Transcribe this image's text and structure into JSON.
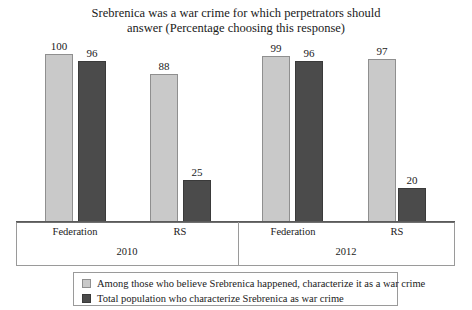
{
  "chart_data": {
    "type": "bar",
    "title": "Srebrenica was a war crime for which perpetrators should answer (Percentage choosing this response)",
    "title_line1": "Srebrenica was a war crime for which perpetrators should",
    "title_line2": "answer (Percentage choosing this response)",
    "xlabel": "",
    "ylabel": "",
    "ylim": [
      0,
      100
    ],
    "grid": false,
    "legend_position": "bottom",
    "categories": [
      "Federation",
      "RS",
      "Federation",
      "RS"
    ],
    "groups": [
      {
        "label": "2010",
        "categories": [
          "Federation",
          "RS"
        ]
      },
      {
        "label": "2012",
        "categories": [
          "Federation",
          "RS"
        ]
      }
    ],
    "series": [
      {
        "name": "Among those who believe Srebrenica happened, characterize it as a war crime",
        "color": "#c9c9c9",
        "values": [
          100,
          88,
          99,
          97
        ]
      },
      {
        "name": "Total population who characterize Srebrenica as war crime",
        "color": "#4b4b4b",
        "values": [
          96,
          25,
          96,
          20
        ]
      }
    ],
    "bars": [
      {
        "group": "2010",
        "category": "Federation",
        "series": "Among those who believe Srebrenica happened, characterize it as a war crime",
        "value": 100,
        "style": "light",
        "x": 45,
        "width": 28
      },
      {
        "group": "2010",
        "category": "Federation",
        "series": "Total population who characterize Srebrenica as war crime",
        "value": 96,
        "style": "dark",
        "x": 78,
        "width": 28
      },
      {
        "group": "2010",
        "category": "RS",
        "series": "Among those who believe Srebrenica happened, characterize it as a war crime",
        "value": 88,
        "style": "light",
        "x": 150,
        "width": 28
      },
      {
        "group": "2010",
        "category": "RS",
        "series": "Total population who characterize Srebrenica as war crime",
        "value": 25,
        "style": "dark",
        "x": 183,
        "width": 28
      },
      {
        "group": "2012",
        "category": "Federation",
        "series": "Among those who believe Srebrenica happened, characterize it as a war crime",
        "value": 99,
        "style": "light",
        "x": 262,
        "width": 28
      },
      {
        "group": "2012",
        "category": "Federation",
        "series": "Total population who characterize Srebrenica as war crime",
        "value": 96,
        "style": "dark",
        "x": 295,
        "width": 28
      },
      {
        "group": "2012",
        "category": "RS",
        "series": "Among those who believe Srebrenica happened, characterize it as a war crime",
        "value": 97,
        "style": "light",
        "x": 368,
        "width": 28
      },
      {
        "group": "2012",
        "category": "RS",
        "series": "Total population who characterize Srebrenica as war crime",
        "value": 20,
        "style": "dark",
        "x": 398,
        "width": 28
      }
    ],
    "axis": {
      "category_labels": [
        {
          "text": "Federation",
          "center": 75
        },
        {
          "text": "RS",
          "center": 180
        },
        {
          "text": "Federation",
          "center": 293
        },
        {
          "text": "RS",
          "center": 397
        }
      ],
      "group_labels": [
        {
          "text": "2010",
          "center": 127
        },
        {
          "text": "2012",
          "center": 346
        }
      ]
    },
    "legend": {
      "entries": [
        {
          "label": "Among those who believe Srebrenica happened, characterize it as a war crime",
          "style": "light"
        },
        {
          "label": "Total population who characterize Srebrenica as war crime",
          "style": "dark"
        }
      ]
    }
  }
}
